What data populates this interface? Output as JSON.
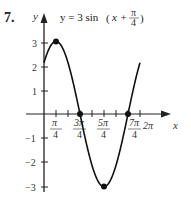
{
  "problem_number": "7.",
  "chart_data": {
    "type": "line",
    "title_parts": {
      "lhs": "y = 3 sin",
      "arg_x": "x +",
      "frac_num": "π",
      "frac_den": "4"
    },
    "xlabel": "x",
    "ylabel": "y",
    "xlim": [
      0,
      6.2832
    ],
    "ylim": [
      -3,
      3
    ],
    "grid": false,
    "x_ticks": [
      {
        "num": "π",
        "den": "4",
        "value": 0.7854
      },
      {
        "num": "3π",
        "den": "4",
        "value": 2.3562
      },
      {
        "num": "5π",
        "den": "4",
        "value": 3.927
      },
      {
        "num": "7π",
        "den": "4",
        "value": 5.4978
      },
      {
        "label": "2π",
        "value": 6.2832
      }
    ],
    "y_ticks": [
      "3",
      "2",
      "1",
      "−1",
      "−2",
      "−3"
    ],
    "series": [
      {
        "name": "y = 3 sin(x + π/4)",
        "x": [
          0,
          0.7854,
          1.5708,
          2.3562,
          3.1416,
          3.927,
          4.7124,
          5.4978,
          6.2832
        ],
        "y": [
          2.12,
          3,
          2.12,
          0,
          -2.12,
          -3,
          -2.12,
          0,
          2.12
        ]
      }
    ],
    "marked_points": [
      {
        "x": 0.7854,
        "y": 3
      },
      {
        "x": 2.3562,
        "y": 0
      },
      {
        "x": 3.927,
        "y": -3
      },
      {
        "x": 5.4978,
        "y": 0
      }
    ]
  }
}
